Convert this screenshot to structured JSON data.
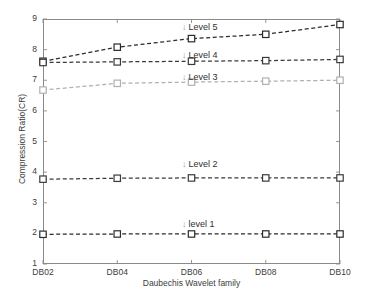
{
  "chart_data": {
    "type": "line",
    "title": "",
    "xlabel": "Daubechis Wavelet family",
    "ylabel": "Compression Ratio(CR)",
    "categories": [
      "DB02",
      "DB04",
      "DB06",
      "DB08",
      "DB10"
    ],
    "ylim": [
      1,
      9
    ],
    "yticks": [
      "1",
      "2",
      "3",
      "4",
      "5",
      "6",
      "7",
      "8",
      "9"
    ],
    "grid": false,
    "legend_position": "inline-annotations",
    "marker": "square",
    "linestyle": "dashed",
    "series": [
      {
        "name": "Level 5",
        "values": [
          7.62,
          8.08,
          8.36,
          8.5,
          8.82
        ],
        "color": "#2b2b2b"
      },
      {
        "name": "Level 4",
        "values": [
          7.58,
          7.6,
          7.62,
          7.64,
          7.68
        ],
        "color": "#3a3a3a"
      },
      {
        "name": "Level 3",
        "values": [
          6.68,
          6.9,
          6.94,
          6.97,
          7.0
        ],
        "color": "#b0b0b0"
      },
      {
        "name": "Level 2",
        "values": [
          3.77,
          3.8,
          3.81,
          3.81,
          3.81
        ],
        "color": "#3a3a3a"
      },
      {
        "name": "level 1",
        "values": [
          1.97,
          1.98,
          1.98,
          1.98,
          1.98
        ],
        "color": "#2b2b2b"
      }
    ],
    "annotations": [
      {
        "text": "Level 5",
        "arrow": "↓",
        "x_px": 182,
        "y_px": 22
      },
      {
        "text": "Level 4",
        "arrow": "↓",
        "x_px": 182,
        "y_px": 50
      },
      {
        "text": "Level 3",
        "arrow": "↓",
        "x_px": 182,
        "y_px": 72
      },
      {
        "text": "Level 2",
        "arrow": "↓",
        "x_px": 182,
        "y_px": 159
      },
      {
        "text": "level 1",
        "arrow": "↓",
        "x_px": 182,
        "y_px": 219
      }
    ]
  }
}
